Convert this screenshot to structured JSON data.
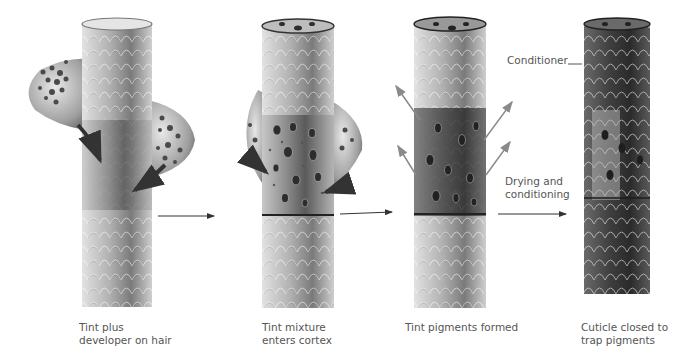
{
  "diagram": {
    "colors": {
      "background": "#ffffff",
      "text": "#555555",
      "hair_light": "#d9d9d9",
      "hair_mid": "#9a9a9a",
      "hair_dark": "#3a3a3a",
      "arrow": "#333333",
      "pigment_arrow": "#8a8a8a"
    },
    "stages": [
      {
        "id": 1,
        "label": "Tint plus\ndeveloper on hair",
        "illustration": "hair-shaft-with-tint-blobs-icon"
      },
      {
        "id": 2,
        "label": "Tint mixture\nenters cortex",
        "illustration": "hair-shaft-cortex-open-icon"
      },
      {
        "id": 3,
        "label": "Tint pigments formed",
        "illustration": "hair-shaft-pigments-icon"
      },
      {
        "id": 4,
        "label": "Cuticle closed to\ntrap pigments",
        "illustration": "hair-shaft-closed-icon"
      }
    ],
    "annotations": {
      "conditioner": "Conditioner",
      "drying": "Drying and\nconditioning"
    },
    "flow_arrows": 3
  }
}
